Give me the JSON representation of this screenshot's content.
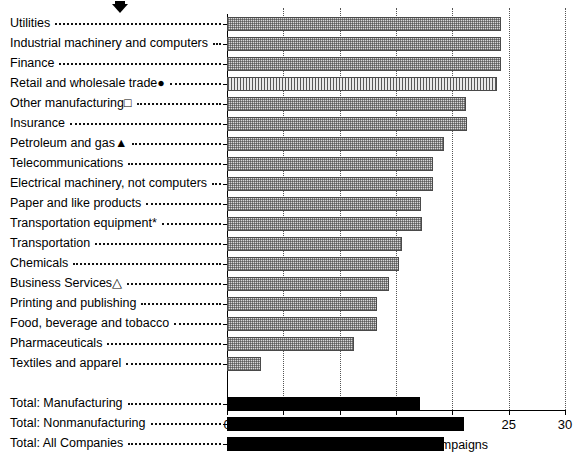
{
  "chart_data": {
    "type": "bar",
    "orientation": "horizontal",
    "title": "",
    "xlabel": "Percent to Federated Campaigns",
    "ylabel": "",
    "xlim": [
      0,
      30
    ],
    "xticks": [
      0,
      5,
      10,
      15,
      20,
      25,
      30
    ],
    "xtick_labels": [
      "0",
      "5",
      "10",
      "15",
      "20",
      "25",
      "30"
    ],
    "grid": "vertical-dotted",
    "legend": "none",
    "categories": [
      "Utilities",
      "Industrial machinery and computers",
      "Finance",
      "Retail and wholesale trade●",
      "Other manufacturing□",
      "Insurance",
      "Petroleum and gas▲",
      "Telecommunications",
      "Electrical machinery, not computers",
      "Paper and like products",
      "Transportation equipment*",
      "Transportation",
      "Chemicals",
      "Business Services△",
      "Printing and publishing",
      "Food, beverage and tobacco",
      "Pharmaceuticals",
      "Textiles and apparel",
      "Total: Manufacturing",
      "Total: Nonmanufacturing",
      "Total: All Companies"
    ],
    "values": [
      24.3,
      24.3,
      24.3,
      24.0,
      21.2,
      21.3,
      19.3,
      18.3,
      18.3,
      17.2,
      17.3,
      15.5,
      15.3,
      14.4,
      13.3,
      13.3,
      11.3,
      3.0,
      17.1,
      21.0,
      19.3
    ],
    "series_styles": [
      "hatched",
      "hatched",
      "hatched",
      "dense-hatched",
      "hatched",
      "hatched",
      "hatched",
      "hatched",
      "hatched",
      "hatched",
      "hatched",
      "hatched",
      "hatched",
      "hatched",
      "hatched",
      "hatched",
      "hatched",
      "hatched",
      "solid-black",
      "solid-black",
      "solid-black"
    ],
    "annotations": [
      {
        "name": "top-marker",
        "symbol": "▼",
        "x_px": 118,
        "y_px": 8
      }
    ],
    "footnote_symbols": {
      "asterisk": "*",
      "filled-circle": "●",
      "open-square": "□",
      "filled-triangle": "▲",
      "open-triangle": "△"
    }
  },
  "axis": {
    "x_title": "Percent to Federated Campaigns"
  }
}
